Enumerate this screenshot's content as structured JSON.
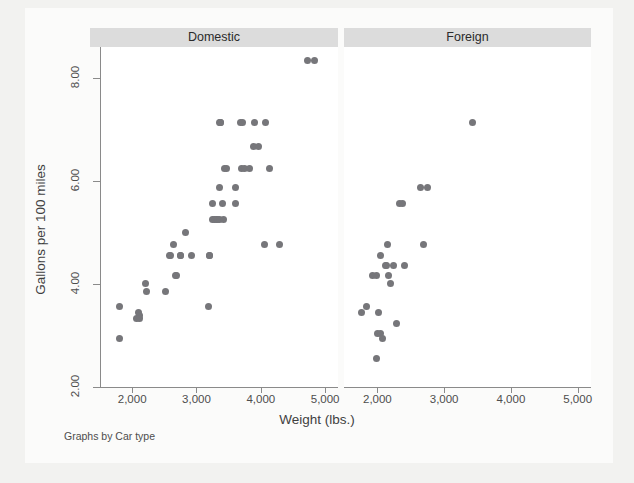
{
  "chart_data": {
    "type": "scatter",
    "title": "",
    "xlabel": "Weight (lbs.)",
    "ylabel": "Gallons per 100 miles",
    "caption": "Graphs by Car type",
    "xlim": [
      1500,
      5200
    ],
    "ylim": [
      2.0,
      8.6
    ],
    "xticks": [
      2000,
      3000,
      4000,
      5000
    ],
    "xtick_labels": [
      "2,000",
      "3,000",
      "4,000",
      "5,000"
    ],
    "yticks": [
      2.0,
      4.0,
      6.0,
      8.0
    ],
    "ytick_labels": [
      "2.00",
      "4.00",
      "6.00",
      "8.00"
    ],
    "grid": false,
    "legend": "none",
    "marker_color": "#76767a",
    "panel_header_color": "#dcdcdc",
    "panels": [
      {
        "label": "Domestic",
        "x": [
          1800,
          1800,
          2070,
          2100,
          2110,
          2110,
          2200,
          2230,
          2520,
          2580,
          2600,
          2650,
          2670,
          2690,
          2750,
          2750,
          2830,
          2930,
          3180,
          3200,
          3210,
          3250,
          3250,
          3280,
          3310,
          3330,
          3350,
          3350,
          3360,
          3370,
          3380,
          3400,
          3420,
          3430,
          3470,
          3600,
          3600,
          3690,
          3700,
          3720,
          3740,
          3830,
          3880,
          3900,
          3960,
          4060,
          4080,
          4130,
          4290,
          4720,
          4840
        ],
        "y": [
          3.57,
          2.94,
          3.33,
          3.45,
          3.38,
          3.33,
          4.0,
          3.85,
          3.85,
          4.55,
          4.55,
          4.76,
          4.17,
          4.17,
          4.55,
          4.55,
          5.0,
          4.55,
          3.57,
          4.55,
          4.55,
          5.26,
          5.56,
          5.26,
          5.26,
          5.26,
          5.26,
          7.14,
          5.88,
          7.14,
          7.14,
          5.56,
          5.26,
          6.25,
          6.25,
          5.88,
          5.56,
          7.14,
          6.25,
          7.14,
          6.25,
          6.25,
          6.67,
          7.14,
          6.67,
          4.76,
          7.14,
          6.25,
          4.76,
          8.33,
          8.33
        ],
        "n": 51
      },
      {
        "label": "Foreign",
        "x": [
          1760,
          1830,
          1930,
          1980,
          1990,
          2000,
          2020,
          2040,
          2050,
          2070,
          2120,
          2130,
          2150,
          2160,
          2200,
          2240,
          2280,
          2330,
          2370,
          2410,
          2650,
          2690,
          2750,
          3420
        ],
        "y": [
          3.45,
          3.57,
          4.17,
          4.17,
          2.56,
          3.03,
          3.45,
          3.03,
          4.55,
          2.94,
          4.35,
          4.35,
          4.76,
          4.17,
          4.0,
          4.35,
          3.23,
          5.56,
          5.56,
          4.35,
          5.88,
          4.76,
          5.88,
          7.14
        ],
        "n": 24
      }
    ]
  }
}
